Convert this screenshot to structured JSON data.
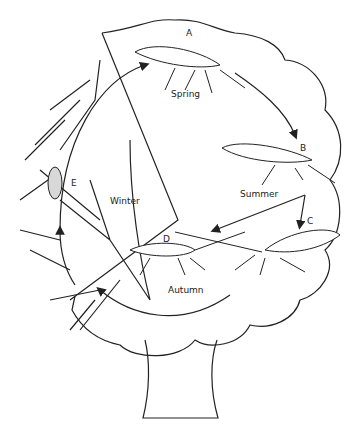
{
  "diagram": {
    "stages": [
      {
        "letter": "A",
        "season": "Spring"
      },
      {
        "letter": "B",
        "season": "Summer"
      },
      {
        "letter": "C",
        "season": ""
      },
      {
        "letter": "D",
        "season": "Autumn"
      },
      {
        "letter": "E",
        "season": "Winter"
      }
    ],
    "labels": {
      "a": "A",
      "b": "B",
      "c": "C",
      "d": "D",
      "e": "E",
      "spring": "Spring",
      "summer": "Summer",
      "autumn": "Autumn",
      "winter": "Winter"
    },
    "colors": {
      "line": "#222222",
      "egg": "#d8d8d8",
      "background": "#ffffff"
    }
  }
}
